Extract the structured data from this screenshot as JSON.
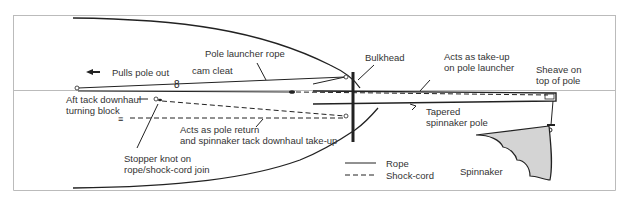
{
  "diagram": {
    "labels": {
      "pole_launcher_rope": "Pole launcher rope",
      "pulls_pole_out": "Pulls pole out",
      "cam_cleat": "cam cleat",
      "bulkhead": "Bulkhead",
      "acts_takeup_line1": "Acts as take-up",
      "acts_takeup_line2": "on pole launcher",
      "sheave_line1": "Sheave on",
      "sheave_line2": "top of pole",
      "aft_tack_line1": "Aft tack downhaul",
      "aft_tack_line2": "turning block",
      "tapered_line1": "Tapered",
      "tapered_line2": "spinnaker pole",
      "pole_return_line1": "Acts as pole return",
      "pole_return_line2": "and spinnaker tack downhaul take-up",
      "stopper_line1": "Stopper knot on",
      "stopper_line2": "rope/shock-cord join",
      "spinnaker": "Spinnaker"
    },
    "legend": {
      "rope": "Rope",
      "shock_cord": "Shock-cord"
    },
    "colors": {
      "line": "#222222",
      "border": "#bbbbbb",
      "sail_fill": "#d4d4d4",
      "text": "#333333"
    }
  }
}
